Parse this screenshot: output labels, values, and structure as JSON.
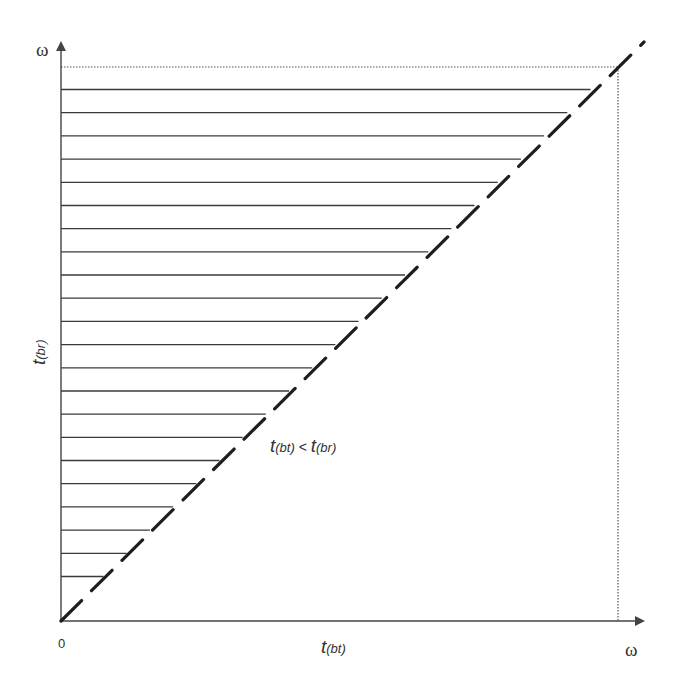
{
  "figure": {
    "y_axis_label": "ω",
    "x_axis_label": "ω",
    "origin_label": "0",
    "y_axis_title": {
      "t": "t",
      "sub": "(br)"
    },
    "x_axis_title": {
      "t": "t",
      "sub": "(bt)"
    },
    "region_annotation": {
      "t1": "t",
      "sub1": "(bt)",
      "op": " < ",
      "t2": "t",
      "sub2": "(br)"
    }
  },
  "chart_data": {
    "type": "diagram",
    "title": "",
    "xlabel": "t(bt)",
    "ylabel": "t(br)",
    "x_axis_end_label": "ω",
    "y_axis_end_label": "ω",
    "origin": "0",
    "diagonal": "dashed line t(bt) = t(br) from origin to (ω, ω)",
    "bounding_box": "dotted lines at t(br) = ω and t(bt) = ω",
    "shaded_region": "hatched with horizontal lines above the diagonal",
    "region_label": "t(bt) < t(br)",
    "hatch_line_count": 22
  },
  "colors": {
    "ink": "#2a2a2a",
    "background": "#ffffff"
  }
}
